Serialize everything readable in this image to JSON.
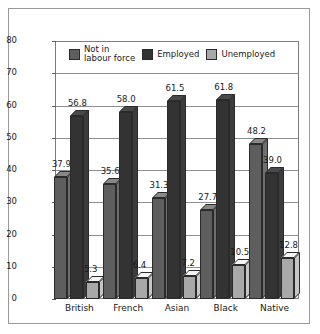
{
  "chart_data": {
    "type": "bar",
    "title": "",
    "xlabel": "",
    "ylabel": "Percentage",
    "ylim": [
      0,
      80
    ],
    "ytick_step": 10,
    "yticks": [
      "80",
      "70",
      "60",
      "50",
      "40",
      "30",
      "20",
      "10",
      "0"
    ],
    "grid": true,
    "legend_position": "inside-top",
    "categories": [
      "British",
      "French",
      "Asian",
      "Black",
      "Native"
    ],
    "series": [
      {
        "name": "Not in labour force",
        "legend_label": "Not in\nlabour force",
        "color": "#5e5e5e",
        "values": [
          37.9,
          35.6,
          31.3,
          27.7,
          48.2
        ],
        "labels": [
          "37.9",
          "35.6",
          "31.3",
          "27.7",
          "48.2"
        ]
      },
      {
        "name": "Employed",
        "legend_label": "Employed",
        "color": "#333333",
        "values": [
          56.8,
          58.0,
          61.5,
          61.8,
          39.0
        ],
        "labels": [
          "56.8",
          "58.0",
          "61.5",
          "61.8",
          "39.0"
        ]
      },
      {
        "name": "Unemployed",
        "legend_label": "Unemployed",
        "color": "#a8a8a8",
        "values": [
          5.3,
          6.4,
          7.2,
          10.5,
          12.8
        ],
        "labels": [
          "5.3",
          "6.4",
          "7.2",
          "10.5",
          "12.8"
        ]
      }
    ]
  },
  "colors": {
    "frame_border": "#9a9a9a",
    "axis": "#7d7d7d",
    "gridline": "#8e8e8e",
    "text": "#1a1a1a",
    "background": "#ffffff"
  }
}
